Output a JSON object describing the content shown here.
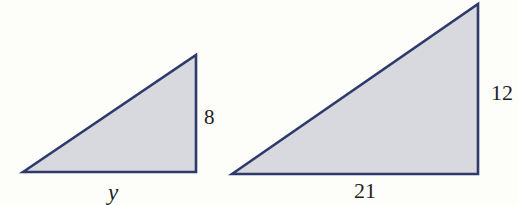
{
  "figure": {
    "type": "similar-right-triangles",
    "small_triangle": {
      "base_label": "y",
      "height_label": "8"
    },
    "large_triangle": {
      "base_label": "21",
      "height_label": "12"
    }
  },
  "colors": {
    "background": "#fdfdfa",
    "triangle_fill": "#d8d9de",
    "triangle_outline": "#2e3a6c"
  }
}
